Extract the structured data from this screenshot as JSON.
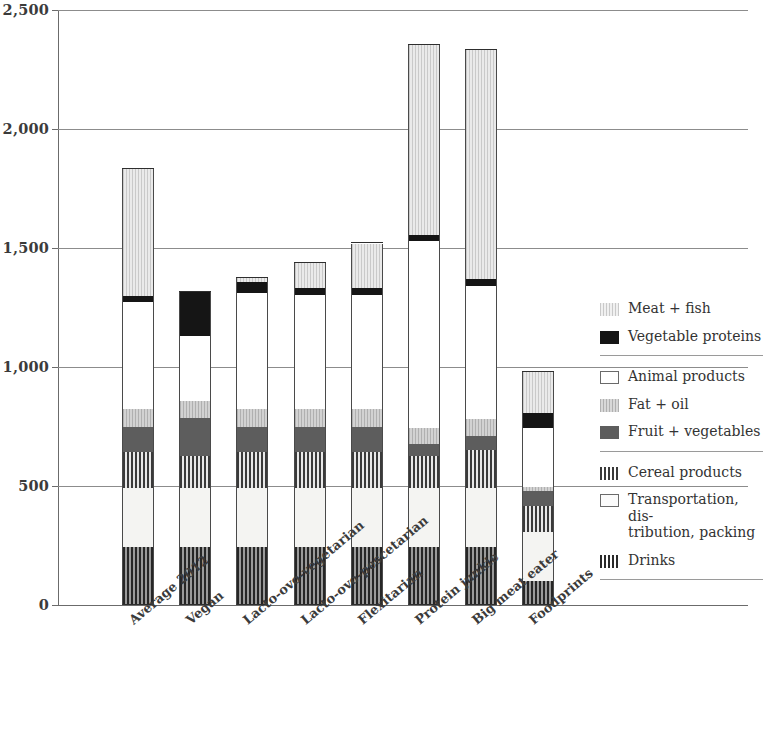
{
  "chart_data": {
    "type": "bar",
    "stacked": true,
    "title": "",
    "subtitle": "",
    "xlabel": "",
    "ylabel": "",
    "ylim": [
      0,
      2500
    ],
    "ytick_values": [
      0,
      500,
      1000,
      1500,
      2000,
      2500
    ],
    "ytick_labels": [
      "0",
      "500",
      "1,000",
      "1,500",
      "2,000",
      "2,500"
    ],
    "grid": true,
    "legend_position": "right",
    "categories": [
      "Average 2012",
      "Vegan",
      "Lacto-ovo-vegetarian",
      "Lacto-ovo-pescetarian",
      "Flexitarian",
      "Protein junkie",
      "Big meat eater",
      "Foodprints"
    ],
    "stack_order_bottom_to_top": [
      "Drinks",
      "Transportation, distribution, packing",
      "Cereal products",
      "Fruit + vegetables",
      "Fat + oil",
      "Animal products",
      "Vegetable proteins",
      "Meat + fish"
    ],
    "series": [
      {
        "name": "Drinks",
        "key": "drinks",
        "values": [
          245,
          245,
          245,
          245,
          245,
          245,
          245,
          100
        ]
      },
      {
        "name": "Transportation, distribution, packing",
        "key": "transport",
        "values": [
          245,
          245,
          245,
          245,
          245,
          245,
          245,
          205
        ]
      },
      {
        "name": "Cereal products",
        "key": "cereal",
        "values": [
          152,
          135,
          152,
          152,
          152,
          135,
          160,
          110
        ]
      },
      {
        "name": "Fruit + vegetables",
        "key": "fruit",
        "values": [
          105,
          160,
          105,
          105,
          105,
          50,
          60,
          65
        ]
      },
      {
        "name": "Fat + oil",
        "key": "fat",
        "values": [
          75,
          72,
          75,
          75,
          75,
          68,
          70,
          15
        ]
      },
      {
        "name": "Animal products",
        "key": "animal",
        "values": [
          450,
          275,
          490,
          480,
          480,
          785,
          560,
          250
        ]
      },
      {
        "name": "Vegetable proteins",
        "key": "vegprot",
        "values": [
          25,
          185,
          45,
          32,
          32,
          25,
          30,
          60
        ]
      },
      {
        "name": "Meat + fish",
        "key": "meat",
        "values": [
          535,
          0,
          18,
          105,
          185,
          800,
          960,
          175
        ]
      }
    ],
    "totals": [
      1832,
      1117,
      1375,
      1439,
      1489,
      2353,
      2330,
      980
    ]
  },
  "legend": {
    "groups": [
      {
        "items": [
          {
            "label": "Meat + fish",
            "swatch": "meat-fish-swatch",
            "swatch_class": "sw-meat"
          },
          {
            "label": "Vegetable proteins",
            "swatch": "vegetable-proteins-swatch",
            "swatch_class": "sw-vegprot"
          }
        ]
      },
      {
        "items": [
          {
            "label": "Animal products",
            "swatch": "animal-products-swatch",
            "swatch_class": "sw-animal"
          },
          {
            "label": "Fat + oil",
            "swatch": "fat-oil-swatch",
            "swatch_class": "sw-fat"
          },
          {
            "label": "Fruit + vegetables",
            "swatch": "fruit-vegetables-swatch",
            "swatch_class": "sw-fruit"
          }
        ]
      },
      {
        "items": [
          {
            "label": "Cereal products",
            "swatch": "cereal-products-swatch",
            "swatch_class": "sw-cereal"
          },
          {
            "label": "Transportation, dis-\ntribution, packing",
            "swatch": "transportation-swatch",
            "swatch_class": "sw-transport"
          },
          {
            "label": "Drinks",
            "swatch": "drinks-swatch",
            "swatch_class": "sw-drinks"
          }
        ]
      }
    ]
  },
  "colors": {
    "meat_fish": "#dcdcdc",
    "vegetable_proteins": "#151515",
    "animal_products": "#ffffff",
    "fat_oil": "#c2c2c2",
    "fruit_vegetables": "#5d5d5d",
    "cereal_products": "#6e6e6e",
    "transportation": "#f4f4f2",
    "drinks": "#4a4a4a",
    "axis": "#6b6b6b",
    "gridline": "#8c8c8c",
    "text": "#3b3b3b"
  }
}
